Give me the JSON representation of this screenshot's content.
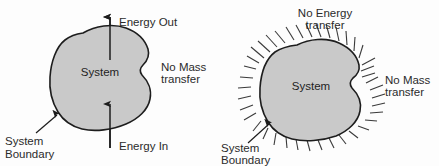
{
  "figure": {
    "background_color": "#fdfdfd",
    "blob_fill_color": "#c9c9c9",
    "blob_stroke_color": "#1d1d1d",
    "hatch_color": "#3a3a3a",
    "text_color": "#2b2b2b"
  },
  "left_diagram": {
    "name": "closed-system",
    "system_label": "System",
    "energy_out_label": "Energy Out",
    "energy_in_label": "Energy In",
    "no_mass_transfer_label_line1": "No Mass",
    "no_mass_transfer_label_line2": "transfer",
    "system_boundary_label_line1": "System",
    "system_boundary_label_line2": "Boundary"
  },
  "right_diagram": {
    "name": "isolated-system",
    "system_label": "System",
    "no_energy_transfer_label_line1": "No Energy",
    "no_energy_transfer_label_line2": "transfer",
    "no_mass_transfer_label_line1": "No Mass",
    "no_mass_transfer_label_line2": "transfer",
    "system_boundary_label_line1": "System",
    "system_boundary_label_line2": "Boundary"
  }
}
